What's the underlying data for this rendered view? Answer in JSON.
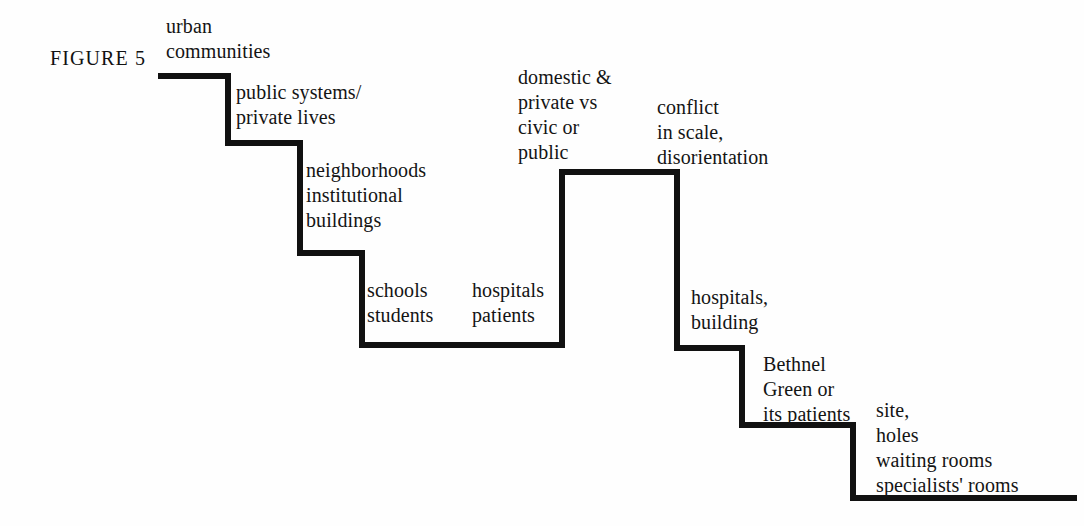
{
  "figure": {
    "caption": "FIGURE 5"
  },
  "canvas": {
    "width": 1084,
    "height": 526,
    "background_color": "#fefefe",
    "line_color": "#111111",
    "line_width": 6
  },
  "diagram": {
    "type": "staircase-step-line",
    "path_points": [
      [
        158,
        76
      ],
      [
        228,
        76
      ],
      [
        228,
        143
      ],
      [
        300,
        143
      ],
      [
        300,
        253
      ],
      [
        362,
        253
      ],
      [
        362,
        345
      ],
      [
        562,
        345
      ],
      [
        562,
        172
      ],
      [
        677,
        172
      ],
      [
        677,
        348
      ],
      [
        742,
        348
      ],
      [
        742,
        425
      ],
      [
        853,
        425
      ],
      [
        853,
        498
      ],
      [
        1077,
        498
      ]
    ]
  },
  "labels": [
    {
      "id": "urban",
      "text": "urban\ncommunities"
    },
    {
      "id": "public",
      "text": "public systems/\nprivate lives"
    },
    {
      "id": "neighborhoods",
      "text": "neighborhoods\ninstitutional\nbuildings"
    },
    {
      "id": "schools",
      "text": "schools\nstudents"
    },
    {
      "id": "hospitals1",
      "text": "hospitals\npatients"
    },
    {
      "id": "domestic",
      "text": "domestic &\nprivate vs\ncivic or\npublic"
    },
    {
      "id": "conflict",
      "text": "conflict\nin scale,\ndisorientation"
    },
    {
      "id": "hospitals2",
      "text": "hospitals,\nbuilding"
    },
    {
      "id": "bethnel",
      "text": "Bethnel\nGreen or\nits patients"
    },
    {
      "id": "site",
      "text": "site,\nholes\nwaiting rooms\nspecialists' rooms"
    }
  ]
}
